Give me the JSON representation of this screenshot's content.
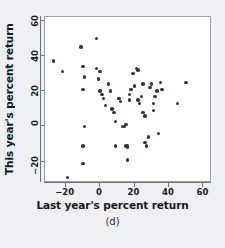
{
  "figure": {
    "caption": "(d)",
    "point_color": "#2b3557",
    "frame_color": "#9aa0a8",
    "background": "#eef0f4"
  },
  "chart_data": {
    "type": "scatter",
    "title": "",
    "xlabel": "Last year's percent return",
    "ylabel": "This year's percent return",
    "xlim": [
      -32,
      65
    ],
    "ylim": [
      -32,
      62
    ],
    "xticks": [
      -20,
      0,
      20,
      40,
      60
    ],
    "yticks": [
      -20,
      0,
      20,
      40,
      60
    ],
    "xtick_labels": [
      "−20",
      "0",
      "20",
      "40",
      "60"
    ],
    "ytick_labels": [
      "−20",
      "0",
      "20",
      "40",
      "60"
    ],
    "grid": false,
    "legend": null,
    "points": [
      [
        -27,
        37
      ],
      [
        -22,
        31
      ],
      [
        -11,
        45
      ],
      [
        -10,
        34
      ],
      [
        -9,
        28
      ],
      [
        -10,
        21
      ],
      [
        -9,
        0
      ],
      [
        -10,
        -11
      ],
      [
        -10,
        -21
      ],
      [
        -19,
        -29
      ],
      [
        -2,
        50
      ],
      [
        -2,
        33
      ],
      [
        -1,
        27
      ],
      [
        0,
        31
      ],
      [
        0,
        20
      ],
      [
        1,
        18
      ],
      [
        2,
        16
      ],
      [
        3,
        12
      ],
      [
        5,
        24
      ],
      [
        6,
        20
      ],
      [
        7,
        10
      ],
      [
        8,
        8
      ],
      [
        9,
        3
      ],
      [
        9,
        -11
      ],
      [
        11,
        16
      ],
      [
        12,
        14
      ],
      [
        13,
        0
      ],
      [
        14,
        0
      ],
      [
        15,
        1
      ],
      [
        15,
        -11
      ],
      [
        16,
        -11
      ],
      [
        16,
        -12
      ],
      [
        16,
        -19
      ],
      [
        17,
        18
      ],
      [
        17,
        15
      ],
      [
        18,
        21
      ],
      [
        19,
        30
      ],
      [
        20,
        23
      ],
      [
        21,
        33
      ],
      [
        22,
        32
      ],
      [
        22,
        15
      ],
      [
        23,
        13
      ],
      [
        24,
        17
      ],
      [
        25,
        24
      ],
      [
        25,
        8
      ],
      [
        26,
        6
      ],
      [
        26,
        -9
      ],
      [
        27,
        -11
      ],
      [
        28,
        -6
      ],
      [
        29,
        22
      ],
      [
        30,
        24
      ],
      [
        31,
        13
      ],
      [
        31,
        9
      ],
      [
        32,
        17
      ],
      [
        33,
        20
      ],
      [
        34,
        -4
      ],
      [
        35,
        25
      ],
      [
        36,
        21
      ],
      [
        45,
        13
      ],
      [
        50,
        25
      ]
    ]
  }
}
